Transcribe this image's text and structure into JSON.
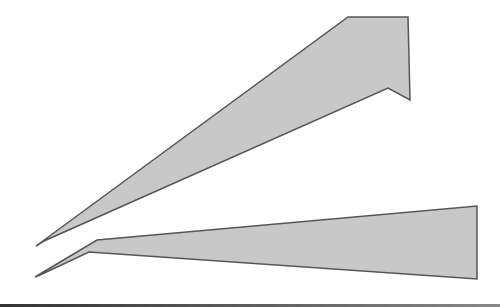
{
  "figure": {
    "shapes": [
      {
        "name": "upper-wedge",
        "fill": "#c8c8c8",
        "stroke": "#555555"
      },
      {
        "name": "lower-wedge",
        "fill": "#c8c8c8",
        "stroke": "#555555"
      }
    ]
  }
}
